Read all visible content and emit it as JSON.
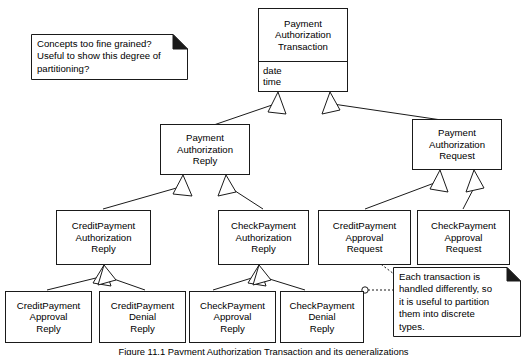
{
  "diagram": {
    "type": "uml-class-diagram",
    "colors": {
      "line": "#1a1a1a",
      "fill": "#ffffff",
      "text": "#000000"
    },
    "classes": [
      {
        "id": "payment-authorization-transaction",
        "name_lines": [
          "Payment",
          "Authorization",
          "Transaction"
        ],
        "attributes": [
          "date",
          "time"
        ]
      },
      {
        "id": "payment-authorization-reply",
        "name_lines": [
          "Payment",
          "Authorization",
          "Reply"
        ],
        "attributes": []
      },
      {
        "id": "payment-authorization-request",
        "name_lines": [
          "Payment",
          "Authorization",
          "Request"
        ],
        "attributes": []
      },
      {
        "id": "creditpayment-authorization-reply",
        "name_lines": [
          "CreditPayment",
          "Authorization",
          "Reply"
        ],
        "attributes": []
      },
      {
        "id": "checkpayment-authorization-reply",
        "name_lines": [
          "CheckPayment",
          "Authorization",
          "Reply"
        ],
        "attributes": []
      },
      {
        "id": "creditpayment-approval-request",
        "name_lines": [
          "CreditPayment",
          "Approval",
          "Request"
        ],
        "attributes": []
      },
      {
        "id": "checkpayment-approval-request",
        "name_lines": [
          "CheckPayment",
          "Approval",
          "Request"
        ],
        "attributes": []
      },
      {
        "id": "creditpayment-approval-reply",
        "name_lines": [
          "CreditPayment",
          "Approval",
          "Reply"
        ],
        "attributes": []
      },
      {
        "id": "creditpayment-denial-reply",
        "name_lines": [
          "CreditPayment",
          "Denial",
          "Reply"
        ],
        "attributes": []
      },
      {
        "id": "checkpayment-approval-reply",
        "name_lines": [
          "CheckPayment",
          "Approval",
          "Reply"
        ],
        "attributes": []
      },
      {
        "id": "checkpayment-denial-reply",
        "name_lines": [
          "CheckPayment",
          "Denial",
          "Reply"
        ],
        "attributes": []
      }
    ],
    "notes": [
      {
        "id": "note-fine-grained",
        "lines": [
          "Concepts too fine grained?",
          "Useful to show this degree of",
          "partitioning?"
        ]
      },
      {
        "id": "note-discrete-types",
        "lines": [
          "Each transaction is",
          "handled differently, so",
          "it is useful to partition",
          "them into discrete",
          "types."
        ]
      }
    ],
    "generalizations": [
      {
        "child": "payment-authorization-reply",
        "parent": "payment-authorization-transaction"
      },
      {
        "child": "payment-authorization-request",
        "parent": "payment-authorization-transaction"
      },
      {
        "child": "creditpayment-authorization-reply",
        "parent": "payment-authorization-reply"
      },
      {
        "child": "checkpayment-authorization-reply",
        "parent": "payment-authorization-reply"
      },
      {
        "child": "creditpayment-approval-request",
        "parent": "payment-authorization-request"
      },
      {
        "child": "checkpayment-approval-request",
        "parent": "payment-authorization-request"
      },
      {
        "child": "creditpayment-approval-reply",
        "parent": "creditpayment-authorization-reply"
      },
      {
        "child": "creditpayment-denial-reply",
        "parent": "creditpayment-authorization-reply"
      },
      {
        "child": "checkpayment-approval-reply",
        "parent": "checkpayment-authorization-reply"
      },
      {
        "child": "checkpayment-denial-reply",
        "parent": "checkpayment-authorization-reply"
      }
    ]
  },
  "caption": {
    "text": "Figure 11.1  Payment Authorization Transaction and its generalizations"
  }
}
